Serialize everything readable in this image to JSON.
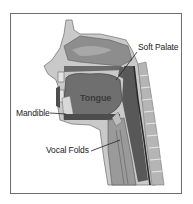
{
  "diagram": {
    "type": "anatomical-cross-section",
    "labels": {
      "soft_palate": "Soft Palate",
      "tongue": "Tongue",
      "mandible": "Mandible",
      "vocal_folds": "Vocal Folds"
    },
    "colors": {
      "frame": "#6e6e6e",
      "tissue_light": "#c9c9c9",
      "tissue_mid": "#9a9a9a",
      "tissue_dark": "#5a5a5a",
      "cavity": "#7c7c7c",
      "spine": "#b5b5b5",
      "label_text": "#222222"
    }
  }
}
